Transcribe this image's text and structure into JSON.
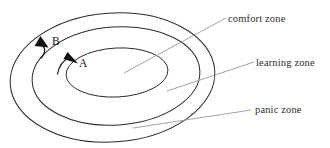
{
  "diagram": {
    "background_color": "#ffffff",
    "stroke_color": "#2b2b2b",
    "leader_color": "#9a9a9a",
    "text_color": "#2e2e2e",
    "zones": [
      {
        "id": "panic",
        "label": "panic zone",
        "ring_order": 3,
        "label_x": 255,
        "label_y": 113,
        "leader": {
          "x1": 133,
          "y1": 128,
          "x2": 251,
          "y2": 110
        }
      },
      {
        "id": "learning",
        "label": "learning zone",
        "ring_order": 2,
        "label_x": 256,
        "label_y": 66,
        "leader": {
          "x1": 167,
          "y1": 91,
          "x2": 254,
          "y2": 62
        }
      },
      {
        "id": "comfort",
        "label": "comfort zone",
        "ring_order": 1,
        "label_x": 228,
        "label_y": 22,
        "leader": {
          "x1": 124,
          "y1": 73,
          "x2": 226,
          "y2": 18
        }
      }
    ],
    "ellipses": [
      {
        "id": "outer-ellipse",
        "cx": 112.5,
        "cy": 77.5,
        "rx": 102.5,
        "ry": 64.5,
        "rotate": -4
      },
      {
        "id": "middle-ellipse",
        "cx": 116.0,
        "cy": 76.0,
        "rx": 84.0,
        "ry": 49.0,
        "rotate": -4
      },
      {
        "id": "inner-ellipse",
        "cx": 117.0,
        "cy": 72.5,
        "rx": 51.0,
        "ry": 24.5,
        "rotate": -3
      }
    ],
    "markers": [
      {
        "id": "marker-b",
        "label": "B",
        "label_x": 52,
        "label_y": 45,
        "tail": "M 40 57 C 44 53 45 49 42 45",
        "head_points": "41,36 48,46 35,45",
        "direction": "up-left"
      },
      {
        "id": "marker-a",
        "label": "A",
        "label_x": 79,
        "label_y": 67,
        "tail": "M 58 73 C 60 66 64 60 70 58",
        "head_points": "78,64 64,58 68,52",
        "direction": "right"
      }
    ]
  }
}
